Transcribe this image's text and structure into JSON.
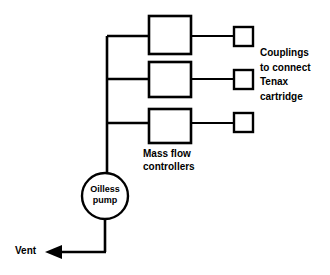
{
  "diagram": {
    "background_color": "#ffffff",
    "line_color": "#000000",
    "labels": {
      "couplings": "Couplings\nto connect\nTenax\ncartridge",
      "mass_flow_controllers": "Mass flow\ncontrollers",
      "pump": "Oilless\npump",
      "vent": "Vent"
    },
    "components": {
      "mass_flow_controllers": [
        {
          "id": "mfc-1",
          "x": 149,
          "y": 16,
          "width": 42,
          "height": 38
        },
        {
          "id": "mfc-2",
          "x": 149,
          "y": 62,
          "width": 42,
          "height": 35
        },
        {
          "id": "mfc-3",
          "x": 149,
          "y": 109,
          "width": 42,
          "height": 34
        }
      ],
      "couplings": [
        {
          "id": "coupling-1",
          "x": 234,
          "y": 27,
          "width": 19,
          "height": 19
        },
        {
          "id": "coupling-2",
          "x": 234,
          "y": 70,
          "width": 19,
          "height": 19
        },
        {
          "id": "coupling-3",
          "x": 234,
          "y": 113,
          "width": 19,
          "height": 19
        }
      ],
      "pump": {
        "id": "oilless-pump",
        "cx": 105,
        "cy": 196,
        "r": 23
      },
      "manifold": {
        "x": 107,
        "y_top": 36,
        "y_bottom": 173
      },
      "vent_arrow": {
        "tip_x": 46,
        "y": 252,
        "from_x": 107
      }
    }
  }
}
